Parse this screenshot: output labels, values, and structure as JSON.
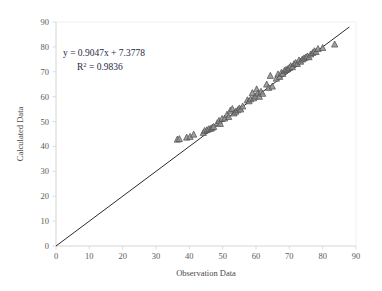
{
  "chart_data": {
    "type": "scatter",
    "title": "",
    "xlabel": "Observation Data",
    "ylabel": "Calculated Data",
    "xlim": [
      0,
      90
    ],
    "ylim": [
      0,
      90
    ],
    "xticks": [
      0,
      10,
      20,
      30,
      40,
      50,
      60,
      70,
      80,
      90
    ],
    "yticks": [
      0,
      10,
      20,
      30,
      40,
      50,
      60,
      70,
      80,
      90
    ],
    "grid": false,
    "legend": "none",
    "marker": "triangle",
    "marker_color": "#8f8f8f",
    "marker_edge_color": "#4d4d4d",
    "line_color": "#2b2b2b",
    "annotations": {
      "equation": "y = 0.9047x + 7.3778",
      "r_squared_prefix": "R",
      "r_squared_exponent": "2",
      "r_squared_value": "= 0.9836",
      "r_squared_full": "R² = 0.9836"
    },
    "trendline": {
      "slope": 0.9047,
      "intercept": 7.3778,
      "r_squared": 0.9836,
      "drawn_from": [
        0,
        0
      ],
      "drawn_to": [
        88,
        88
      ]
    },
    "points": [
      [
        36.4,
        42.8
      ],
      [
        37.0,
        43.0
      ],
      [
        39.2,
        43.6
      ],
      [
        40.2,
        43.9
      ],
      [
        41.3,
        44.8
      ],
      [
        44.2,
        45.5
      ],
      [
        44.6,
        46.3
      ],
      [
        45.3,
        46.6
      ],
      [
        45.9,
        47.0
      ],
      [
        46.5,
        47.2
      ],
      [
        46.9,
        47.6
      ],
      [
        47.3,
        47.9
      ],
      [
        48.4,
        49.4
      ],
      [
        48.9,
        50.3
      ],
      [
        49.3,
        49.1
      ],
      [
        49.8,
        51.1
      ],
      [
        50.6,
        51.3
      ],
      [
        51.3,
        52.8
      ],
      [
        51.8,
        51.9
      ],
      [
        52.3,
        54.4
      ],
      [
        52.9,
        55.1
      ],
      [
        53.4,
        53.3
      ],
      [
        53.9,
        54.0
      ],
      [
        54.5,
        54.6
      ],
      [
        55.0,
        55.3
      ],
      [
        55.4,
        54.9
      ],
      [
        56.0,
        56.1
      ],
      [
        57.4,
        58.6
      ],
      [
        57.9,
        58.2
      ],
      [
        58.4,
        59.0
      ],
      [
        58.9,
        61.5
      ],
      [
        59.3,
        59.4
      ],
      [
        59.8,
        60.1
      ],
      [
        60.2,
        63.0
      ],
      [
        60.6,
        61.3
      ],
      [
        61.0,
        60.0
      ],
      [
        61.5,
        62.0
      ],
      [
        62.0,
        61.2
      ],
      [
        63.2,
        64.9
      ],
      [
        63.8,
        63.6
      ],
      [
        64.3,
        68.4
      ],
      [
        64.9,
        64.1
      ],
      [
        66.1,
        67.3
      ],
      [
        66.6,
        69.0
      ],
      [
        67.1,
        68.0
      ],
      [
        67.6,
        69.6
      ],
      [
        68.0,
        69.2
      ],
      [
        68.5,
        70.4
      ],
      [
        69.0,
        70.8
      ],
      [
        69.5,
        71.1
      ],
      [
        70.0,
        71.6
      ],
      [
        70.4,
        72.3
      ],
      [
        70.9,
        71.9
      ],
      [
        71.4,
        73.1
      ],
      [
        71.9,
        73.6
      ],
      [
        72.4,
        73.2
      ],
      [
        72.9,
        74.6
      ],
      [
        73.4,
        74.1
      ],
      [
        73.9,
        75.0
      ],
      [
        74.4,
        75.4
      ],
      [
        74.9,
        75.8
      ],
      [
        75.4,
        76.2
      ],
      [
        75.9,
        75.9
      ],
      [
        76.4,
        77.0
      ],
      [
        77.0,
        77.6
      ],
      [
        77.5,
        78.3
      ],
      [
        78.0,
        78.0
      ],
      [
        78.6,
        79.2
      ],
      [
        80.0,
        79.6
      ],
      [
        83.6,
        81.0
      ]
    ]
  }
}
